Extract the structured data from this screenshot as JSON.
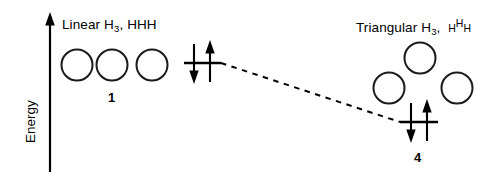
{
  "figure": {
    "type": "energy-level-diagram",
    "background_color": "#ffffff",
    "stroke_color": "#000000",
    "width": 504,
    "height": 181
  },
  "axis": {
    "label": "Energy",
    "direction": "up",
    "arrow_head": "filled-triangle"
  },
  "states": [
    {
      "id": "linear",
      "title_prefix": "Linear",
      "formula_element": "H",
      "formula_subscript": "3",
      "separator": ",",
      "connectivity": "HHH",
      "geometry": "linear",
      "atom_count": 3,
      "number_label": "1",
      "relative_energy": "higher",
      "level_electrons": [
        "down",
        "up"
      ],
      "level_electron_count": 2
    },
    {
      "id": "triangular",
      "title_prefix": "Triangular",
      "formula_element": "H",
      "formula_subscript": "3",
      "separator": ",",
      "connectivity_left": "H",
      "connectivity_top": "H",
      "connectivity_right": "H",
      "geometry": "triangular",
      "atom_count": 3,
      "number_label": "4",
      "relative_energy": "lower",
      "level_electrons": [
        "down",
        "up"
      ],
      "level_electron_count": 2
    }
  ],
  "connector": {
    "style": "dashed",
    "from_state": "linear",
    "to_state": "triangular",
    "slope": "descending"
  }
}
